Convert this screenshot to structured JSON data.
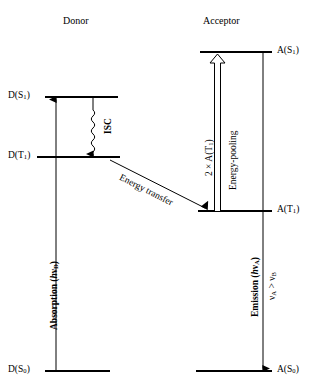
{
  "figure": {
    "type": "energy-level-jablonski-diagram",
    "headers": {
      "donor": "Donor",
      "acceptor": "Acceptor"
    },
    "levels": [
      {
        "id": "D_S1",
        "label": "D(S₁)",
        "side": "donor",
        "y": 97,
        "x1": 45,
        "x2": 118
      },
      {
        "id": "D_T1",
        "label": "D(T₁)",
        "side": "donor",
        "y": 157,
        "x1": 37,
        "x2": 120
      },
      {
        "id": "D_S0",
        "label": "D(S₀)",
        "side": "donor",
        "y": 371,
        "x1": 45,
        "x2": 110
      },
      {
        "id": "A_S1",
        "label": "A(S₁)",
        "side": "acceptor",
        "y": 52,
        "x1": 200,
        "x2": 272
      },
      {
        "id": "A_T1",
        "label": "A(T₁)",
        "side": "acceptor",
        "y": 211,
        "x1": 198,
        "x2": 272
      },
      {
        "id": "A_S0",
        "label": "A(S₀)",
        "side": "acceptor",
        "y": 371,
        "x1": 196,
        "x2": 272
      }
    ],
    "processes": [
      {
        "id": "absorption",
        "label": "Absorption (hν",
        "sub": "D",
        "tail": ")",
        "kind": "straight-arrow-up",
        "from": "D_S0",
        "to": "D_S1"
      },
      {
        "id": "isc",
        "label": "ISC",
        "kind": "wavy-arrow-down",
        "from": "D_S1",
        "to": "D_T1"
      },
      {
        "id": "energy-transfer",
        "label": "Energy transfer",
        "kind": "diagonal-arrow",
        "from": "D_T1",
        "to": "A_T1"
      },
      {
        "id": "energy-pooling",
        "label": "Energy-pooling",
        "kind": "hollow-arrow-up",
        "from": "A_T1",
        "to": "A_S1"
      },
      {
        "id": "pooling-stoich",
        "label": "2 × A(T₁)",
        "kind": "annotation"
      },
      {
        "id": "emission",
        "label": "Emission (hν",
        "sub": "A",
        "tail": ")",
        "kind": "straight-arrow-down",
        "from": "A_S1",
        "to": "A_S0"
      },
      {
        "id": "frequency-note",
        "label": "ν",
        "sub1": "A",
        "mid": " > ν",
        "sub2": "B",
        "kind": "annotation"
      }
    ]
  },
  "colors": {
    "ink": "#000000",
    "background": "#ffffff"
  }
}
